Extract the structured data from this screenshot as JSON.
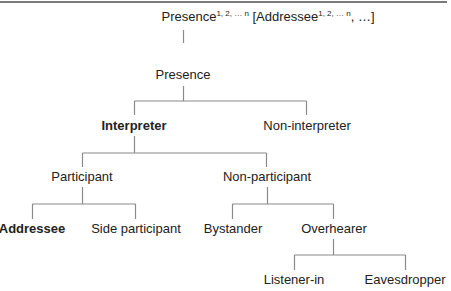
{
  "diagram": {
    "type": "tree",
    "line_color": "#8a8a8a",
    "text_color": "#222222",
    "root": {
      "prefix": "Presence",
      "sup1": "1, 2, … n",
      "middle": " [Addressee",
      "sup2": "1, 2, … n",
      "suffix": ", …]"
    },
    "nodes": {
      "presence": "Presence",
      "interpreter": "Interpreter",
      "non_interpreter": "Non-interpreter",
      "participant": "Participant",
      "non_participant": "Non-participant",
      "addressee": "Addressee",
      "side_participant": "Side participant",
      "bystander": "Bystander",
      "overhearer": "Overhearer",
      "listener_in": "Listener-in",
      "eavesdropper": "Eavesdropper"
    },
    "edges": [
      [
        "root",
        "presence"
      ],
      [
        "presence",
        "interpreter"
      ],
      [
        "presence",
        "non_interpreter"
      ],
      [
        "interpreter",
        "participant"
      ],
      [
        "interpreter",
        "non_participant"
      ],
      [
        "participant",
        "addressee"
      ],
      [
        "participant",
        "side_participant"
      ],
      [
        "non_participant",
        "bystander"
      ],
      [
        "non_participant",
        "overhearer"
      ],
      [
        "overhearer",
        "listener_in"
      ],
      [
        "overhearer",
        "eavesdropper"
      ]
    ],
    "bold_nodes": [
      "interpreter",
      "addressee"
    ]
  }
}
